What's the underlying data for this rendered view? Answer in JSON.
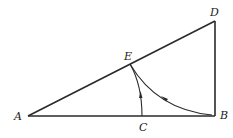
{
  "diagram": {
    "points": {
      "A": {
        "label": "A"
      },
      "B": {
        "label": "B"
      },
      "C": {
        "label": "C"
      },
      "D": {
        "label": "D"
      },
      "E": {
        "label": "E"
      }
    },
    "segments": [
      "AB",
      "AD",
      "BD"
    ],
    "curves": [
      {
        "from": "C",
        "to": "E",
        "arrow": "up",
        "description": "arc from C to E"
      },
      {
        "from": "B",
        "to": "E",
        "arrow": "toward E",
        "description": "curved path from B to E"
      }
    ]
  }
}
